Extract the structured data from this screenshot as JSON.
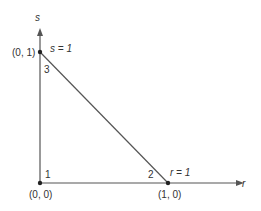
{
  "axes": {
    "x_label": "r",
    "y_label": "s"
  },
  "vertices": [
    {
      "id": "1",
      "coord": "(0, 0)"
    },
    {
      "id": "2",
      "coord": "(1, 0)",
      "edge_label": "r = 1"
    },
    {
      "id": "3",
      "coord": "(0, 1)",
      "edge_label": "s = 1"
    }
  ],
  "colors": {
    "line": "#555555",
    "text": "#333333"
  }
}
